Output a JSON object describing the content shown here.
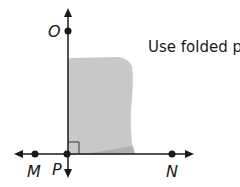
{
  "caption": "Use folded paper",
  "points": {
    "O": "O",
    "M": "M",
    "P": "P",
    "N": "N"
  },
  "colors": {
    "paper": "#c8c8c8",
    "line": "#1a1a1a"
  }
}
